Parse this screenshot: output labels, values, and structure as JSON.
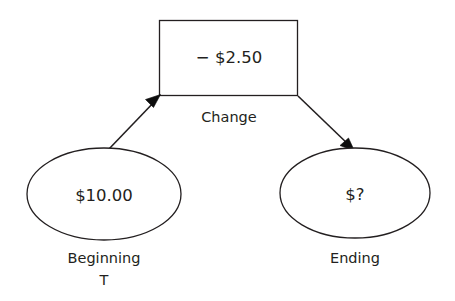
{
  "diagram": {
    "background_color": "#ffffff",
    "stroke_color": "#231f20",
    "text_color": "#231f20",
    "nodes": {
      "change": {
        "value": "− $2.50",
        "caption": "Change",
        "shape": "rectangle"
      },
      "beginning": {
        "value": "$10.00",
        "caption": "Beginning",
        "caption_second_line": "T",
        "shape": "ellipse"
      },
      "ending": {
        "value": "$?",
        "caption": "Ending",
        "shape": "ellipse"
      }
    },
    "arrows": [
      {
        "name": "beginning-to-change",
        "from": "beginning",
        "to": "change",
        "direction": "up-right"
      },
      {
        "name": "change-to-ending",
        "from": "change",
        "to": "ending",
        "direction": "down-right"
      }
    ]
  }
}
